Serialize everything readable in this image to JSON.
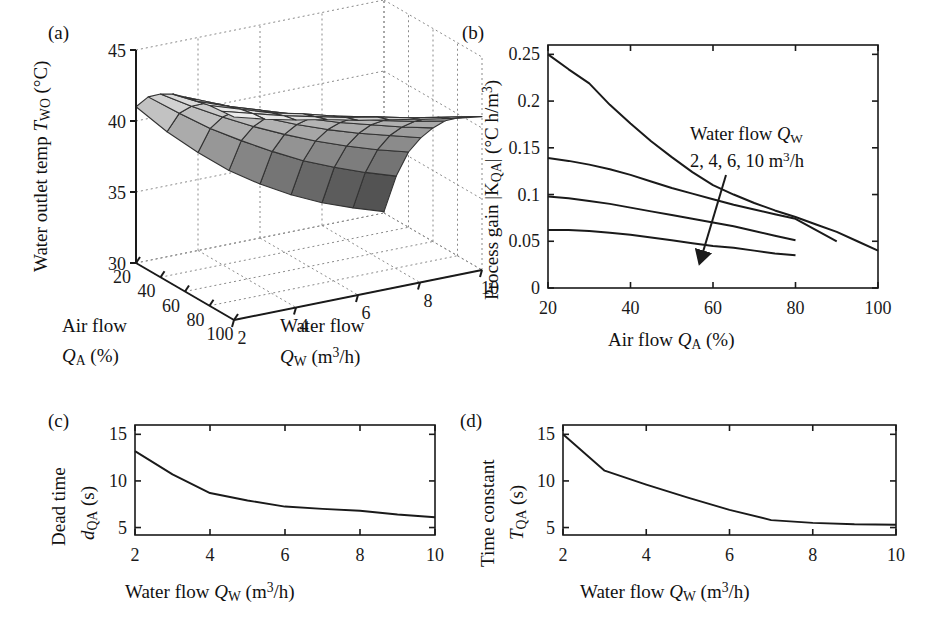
{
  "figure": {
    "width": 936,
    "height": 639,
    "background": "#ffffff",
    "line_color": "#1a1a1a"
  },
  "panels": {
    "a": {
      "tag": "(a)",
      "type": "surface3d",
      "zlabel_prefix": "Water outlet temp ",
      "zlabel_sym": "T",
      "zlabel_sub": "WO",
      "zlabel_unit": " (°C)",
      "xlabel_line1": "Air flow",
      "xlabel_sym": "Q",
      "xlabel_sub": "A",
      "xlabel_unit": " (%)",
      "ylabel_line1": "Water flow",
      "ylabel_sym": "Q",
      "ylabel_sub": "W",
      "ylabel_unit": " (m",
      "ylabel_sup": "3",
      "ylabel_unit2": "/h)",
      "z_ticks": [
        "30",
        "35",
        "40",
        "45"
      ],
      "z_tick_values": [
        30,
        35,
        40,
        45
      ],
      "air_ticks": [
        "20",
        "40",
        "60",
        "80",
        "100"
      ],
      "air_tick_values": [
        20,
        40,
        60,
        80,
        100
      ],
      "water_ticks": [
        "2",
        "4",
        "6",
        "8",
        "10"
      ],
      "water_tick_values": [
        2,
        4,
        6,
        8,
        10
      ],
      "zlim": [
        30,
        45
      ],
      "air_range": [
        20,
        100
      ],
      "water_range": [
        2,
        10
      ]
    },
    "b": {
      "tag": "(b)",
      "ylabel_prefix": "Process gain ",
      "ylabel_sym": "|K",
      "ylabel_sub": "QA",
      "ylabel_sym2": "|",
      "ylabel_unit": " (°C h/m",
      "ylabel_sup": "3",
      "ylabel_unit2": ")",
      "xlabel_prefix": "Air flow ",
      "xlabel_sym": "Q",
      "xlabel_sub": "A",
      "xlabel_unit": " (%)",
      "annotation_line1_prefix": "Water flow ",
      "annotation_line1_sym": "Q",
      "annotation_line1_sub": "W",
      "annotation_line2_prefix": "2, 4, 6, 10 m",
      "annotation_line2_sup": "3",
      "annotation_line2_suffix": "/h"
    },
    "c": {
      "tag": "(c)",
      "ylabel_line1": "Dead time",
      "ylabel_sym": "d",
      "ylabel_sub": "QA",
      "ylabel_unit": " (s)",
      "xlabel_prefix": "Water flow ",
      "xlabel_sym": "Q",
      "xlabel_sub": "W",
      "xlabel_unit": " (m",
      "xlabel_sup": "3",
      "xlabel_unit2": "/h)"
    },
    "d": {
      "tag": "(d)",
      "ylabel_line1": "Time constant",
      "ylabel_sym": "T",
      "ylabel_sub": "QA",
      "ylabel_unit": " (s)",
      "xlabel_prefix": "Water flow ",
      "xlabel_sym": "Q",
      "xlabel_sub": "W",
      "xlabel_unit": " (m",
      "xlabel_sup": "3",
      "xlabel_unit2": "/h)"
    }
  },
  "chart_data": [
    {
      "panel": "a",
      "type": "surface",
      "title": "(a) Water outlet temperature surface",
      "xlabel": "Air flow Q_A (%)",
      "ylabel": "Water flow Q_W (m3/h)",
      "zlabel": "Water outlet temp T_WO (degC)",
      "x": [
        20,
        30,
        40,
        50,
        60,
        70,
        80,
        90,
        100
      ],
      "y": [
        2,
        3,
        4,
        5,
        6,
        7,
        8,
        9,
        10
      ],
      "zlim": [
        30,
        45
      ],
      "xlim": [
        20,
        100
      ],
      "ylim": [
        2,
        10
      ],
      "grid": true,
      "colormap": "gray",
      "z": [
        [
          41.0,
          42.2,
          42.9,
          43.4,
          43.7,
          43.9,
          44.1,
          44.2,
          44.3
        ],
        [
          38.8,
          40.6,
          41.6,
          42.3,
          42.8,
          43.1,
          43.4,
          43.6,
          43.7
        ],
        [
          36.9,
          39.1,
          40.4,
          41.3,
          41.9,
          42.4,
          42.7,
          43.0,
          43.2
        ],
        [
          35.2,
          37.8,
          39.3,
          40.4,
          41.2,
          41.7,
          42.2,
          42.5,
          42.8
        ],
        [
          33.8,
          36.6,
          38.3,
          39.5,
          40.4,
          41.1,
          41.6,
          42.0,
          42.3
        ],
        [
          32.6,
          35.5,
          37.4,
          38.7,
          39.7,
          40.5,
          41.1,
          41.6,
          41.9
        ],
        [
          31.6,
          34.6,
          36.6,
          38.0,
          39.1,
          39.9,
          40.6,
          41.1,
          41.5
        ],
        [
          30.8,
          33.8,
          35.9,
          37.4,
          38.5,
          39.4,
          40.1,
          40.7,
          41.1
        ],
        [
          30.1,
          33.1,
          35.3,
          36.8,
          38.0,
          39.0,
          39.7,
          40.3,
          40.8
        ]
      ]
    },
    {
      "panel": "b",
      "type": "line",
      "title": "(b) Process gain vs air flow",
      "xlabel": "Air flow Q_A (%)",
      "ylabel": "Process gain |K_QA| (degC h/m3)",
      "xlim": [
        20,
        100
      ],
      "ylim": [
        0,
        0.26
      ],
      "xticks": [
        20,
        40,
        60,
        80,
        100
      ],
      "yticks": [
        0,
        0.05,
        0.1,
        0.15,
        0.2,
        0.25
      ],
      "ytick_labels": [
        "0",
        "0.05",
        "0.1",
        "0.15",
        "0.2",
        "0.25"
      ],
      "grid": false,
      "legend": "annotation-arrow",
      "series": [
        {
          "name": "2 m3/h",
          "x": [
            20,
            25,
            30,
            35,
            40,
            45,
            50,
            55,
            60,
            65,
            70,
            75,
            80,
            85,
            90,
            95,
            100
          ],
          "y": [
            0.25,
            0.234,
            0.219,
            0.196,
            0.176,
            0.157,
            0.14,
            0.124,
            0.11,
            0.1,
            0.091,
            0.083,
            0.076,
            0.068,
            0.06,
            0.05,
            0.04
          ]
        },
        {
          "name": "4 m3/h",
          "x": [
            20,
            25,
            30,
            35,
            40,
            45,
            50,
            55,
            60,
            65,
            70,
            75,
            80,
            85,
            90
          ],
          "y": [
            0.139,
            0.136,
            0.132,
            0.127,
            0.121,
            0.114,
            0.107,
            0.101,
            0.095,
            0.089,
            0.084,
            0.079,
            0.074,
            0.062,
            0.05
          ]
        },
        {
          "name": "6 m3/h",
          "x": [
            20,
            25,
            30,
            35,
            40,
            45,
            50,
            55,
            60,
            65,
            70,
            75,
            80
          ],
          "y": [
            0.098,
            0.096,
            0.093,
            0.09,
            0.086,
            0.082,
            0.078,
            0.074,
            0.07,
            0.066,
            0.061,
            0.056,
            0.051
          ]
        },
        {
          "name": "10 m3/h",
          "x": [
            20,
            25,
            30,
            35,
            40,
            45,
            50,
            55,
            60,
            65,
            70,
            75,
            80
          ],
          "y": [
            0.062,
            0.062,
            0.061,
            0.059,
            0.057,
            0.054,
            0.051,
            0.048,
            0.045,
            0.043,
            0.04,
            0.037,
            0.035
          ]
        }
      ]
    },
    {
      "panel": "c",
      "type": "line",
      "title": "(c) Dead time vs water flow",
      "xlabel": "Water flow Q_W (m3/h)",
      "ylabel": "Dead time d_QA (s)",
      "xlim": [
        2,
        10
      ],
      "ylim": [
        4.2,
        16.0
      ],
      "xticks": [
        2,
        4,
        6,
        8,
        10
      ],
      "yticks": [
        5,
        10,
        15
      ],
      "grid": false,
      "series": [
        {
          "name": "dead time",
          "x": [
            2,
            3,
            4,
            5,
            6,
            7,
            8,
            9,
            10
          ],
          "y": [
            13.2,
            10.7,
            8.7,
            7.9,
            7.25,
            7.0,
            6.8,
            6.4,
            6.1
          ]
        }
      ]
    },
    {
      "panel": "d",
      "type": "line",
      "title": "(d) Time constant vs water flow",
      "xlabel": "Water flow Q_W (m3/h)",
      "ylabel": "Time constant T_QA (s)",
      "xlim": [
        2,
        10
      ],
      "ylim": [
        4.2,
        16.0
      ],
      "xticks": [
        2,
        4,
        6,
        8,
        10
      ],
      "yticks": [
        5,
        10,
        15
      ],
      "grid": false,
      "series": [
        {
          "name": "time constant",
          "x": [
            2,
            3,
            4,
            5,
            6,
            7,
            8,
            9,
            10
          ],
          "y": [
            15.0,
            11.1,
            9.6,
            8.2,
            6.9,
            5.8,
            5.5,
            5.35,
            5.3
          ]
        }
      ]
    }
  ]
}
